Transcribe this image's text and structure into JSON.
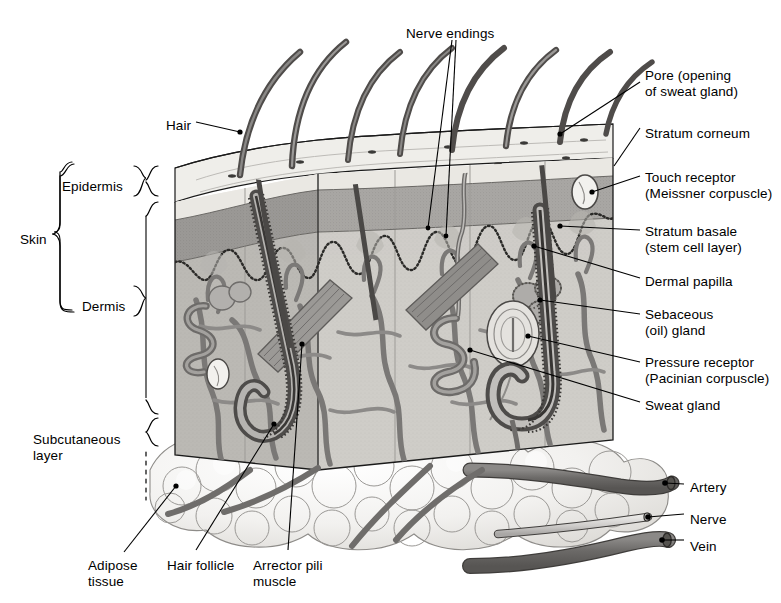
{
  "diagram": {
    "view": "3D block cutaway",
    "palette": {
      "ink": "#1a1a1a",
      "stratum_corneum": "#e9e7e2",
      "epidermis": "#a9a7a4",
      "dermis": "#cfcdc8",
      "dermis_shadow": "#b9b7b2",
      "subcutaneous": "#f4f3f1",
      "vessel_dark": "#6f6d6b",
      "vessel_mid": "#8a8886",
      "hair": "#55524f",
      "muscle": "#7c7a77",
      "gland": "#9a9795",
      "leader_line": "#000000"
    }
  },
  "labels": {
    "top": [
      {
        "id": "nerve-endings",
        "text": "Nerve endings",
        "x": 406,
        "y": 26,
        "align": "left"
      },
      {
        "id": "hair",
        "text": "Hair",
        "x": 166,
        "y": 118,
        "align": "left"
      }
    ],
    "right": [
      {
        "id": "pore",
        "text": "Pore (opening\nof sweat gland)",
        "x": 645,
        "y": 68,
        "align": "left"
      },
      {
        "id": "stratum-corneum",
        "text": "Stratum corneum",
        "x": 645,
        "y": 126,
        "align": "left"
      },
      {
        "id": "touch-receptor",
        "text": "Touch receptor\n(Meissner corpuscle)",
        "x": 645,
        "y": 170,
        "align": "left"
      },
      {
        "id": "stratum-basale",
        "text": "Stratum basale\n(stem cell layer)",
        "x": 645,
        "y": 224,
        "align": "left"
      },
      {
        "id": "dermal-papilla",
        "text": "Dermal papilla",
        "x": 645,
        "y": 274,
        "align": "left"
      },
      {
        "id": "sebaceous-gland",
        "text": "Sebaceous\n(oil) gland",
        "x": 645,
        "y": 307,
        "align": "left"
      },
      {
        "id": "pressure-receptor",
        "text": "Pressure receptor\n(Pacinian corpuscle)",
        "x": 645,
        "y": 355,
        "align": "left"
      },
      {
        "id": "sweat-gland",
        "text": "Sweat gland",
        "x": 645,
        "y": 398,
        "align": "left"
      },
      {
        "id": "artery",
        "text": "Artery",
        "x": 690,
        "y": 480,
        "align": "left"
      },
      {
        "id": "nerve",
        "text": "Nerve",
        "x": 690,
        "y": 512,
        "align": "left"
      },
      {
        "id": "vein",
        "text": "Vein",
        "x": 690,
        "y": 539,
        "align": "left"
      }
    ],
    "left": [
      {
        "id": "skin",
        "text": "Skin",
        "x": 20,
        "y": 232,
        "align": "left"
      },
      {
        "id": "epidermis",
        "text": "Epidermis",
        "x": 62,
        "y": 179,
        "align": "left"
      },
      {
        "id": "dermis",
        "text": "Dermis",
        "x": 82,
        "y": 299,
        "align": "left"
      },
      {
        "id": "subcutaneous-layer",
        "text": "Subcutaneous\nlayer",
        "x": 33,
        "y": 432,
        "align": "left"
      }
    ],
    "bottom": [
      {
        "id": "adipose-tissue",
        "text": "Adipose\ntissue",
        "x": 88,
        "y": 558,
        "align": "left"
      },
      {
        "id": "hair-follicle",
        "text": "Hair follicle",
        "x": 167,
        "y": 558,
        "align": "left"
      },
      {
        "id": "arrector-pili-muscle",
        "text": "Arrector pili\nmuscle",
        "x": 253,
        "y": 558,
        "align": "left"
      }
    ]
  },
  "braces": {
    "skin": {
      "label": "Skin"
    },
    "epidermis": {
      "label": "Epidermis"
    },
    "dermis": {
      "label": "Dermis"
    },
    "subcutaneous": {
      "label": "Subcutaneous layer"
    }
  },
  "structures": [
    {
      "name": "hair-shaft",
      "count": 8
    },
    {
      "name": "stratum-corneum-band"
    },
    {
      "name": "epidermis-band"
    },
    {
      "name": "stratum-basale-dotted-line"
    },
    {
      "name": "dermal-papillae"
    },
    {
      "name": "meissner-corpuscle"
    },
    {
      "name": "pacinian-corpuscle"
    },
    {
      "name": "sebaceous-gland"
    },
    {
      "name": "sweat-gland-coil"
    },
    {
      "name": "sweat-duct"
    },
    {
      "name": "hair-follicle"
    },
    {
      "name": "arrector-pili-muscle"
    },
    {
      "name": "adipose-tissue-lobules"
    },
    {
      "name": "artery"
    },
    {
      "name": "vein"
    },
    {
      "name": "nerve"
    }
  ]
}
